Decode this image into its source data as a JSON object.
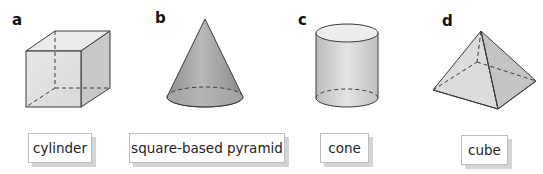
{
  "shapes": [
    {
      "letter": "a",
      "shape": "cube"
    },
    {
      "letter": "b",
      "shape": "cone"
    },
    {
      "letter": "c",
      "shape": "cylinder"
    },
    {
      "letter": "d",
      "shape": "square-based pyramid"
    }
  ],
  "labels": [
    "cylinder",
    "square-based pyramid",
    "cone",
    "cube"
  ],
  "colors": {
    "shape_fill_light": "#e6e6e6",
    "shape_fill_mid": "#cfcfcf",
    "shape_fill_dark": "#a8a8a8",
    "edge": "#3a3a3a",
    "label_border": "#bdbdbd",
    "label_shadow": "#d4d4d4"
  }
}
